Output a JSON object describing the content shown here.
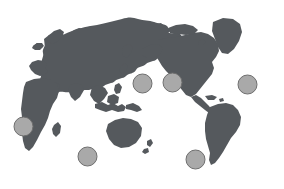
{
  "figure": {
    "name": "world-map-with-region-markers",
    "title": "World map with circular region markers",
    "projection": "pacific-centered-equirectangular",
    "width": 284,
    "height": 189,
    "background_color": "#ffffff"
  },
  "map": {
    "land_color": "#55595d",
    "land_stroke_color": "#55595d",
    "ocean_color": "#ffffff",
    "regions": [
      "Eurasia",
      "Africa",
      "Australia",
      "North America",
      "South America",
      "Greenland",
      "Maritime Southeast Asia"
    ]
  },
  "markers": {
    "fill_color": "#a9a9a9",
    "stroke_color": "#6e6e6e",
    "radius": 9.5,
    "count": 6,
    "items": [
      {
        "id": "marker-1",
        "label": "North Pacific West",
        "cx": 142.5,
        "cy": 83.5,
        "r": 9.5
      },
      {
        "id": "marker-2",
        "label": "North Pacific Central",
        "cx": 172.5,
        "cy": 82.5,
        "r": 9.5
      },
      {
        "id": "marker-3",
        "label": "North Atlantic",
        "cx": 247.5,
        "cy": 84.5,
        "r": 9.5
      },
      {
        "id": "marker-4",
        "label": "Eastern Atlantic",
        "cx": 23.5,
        "cy": 126.5,
        "r": 9.5
      },
      {
        "id": "marker-5",
        "label": "Indian Ocean",
        "cx": 87.5,
        "cy": 156.5,
        "r": 9.5
      },
      {
        "id": "marker-6",
        "label": "South Pacific",
        "cx": 195.5,
        "cy": 159.5,
        "r": 9.5
      }
    ]
  }
}
